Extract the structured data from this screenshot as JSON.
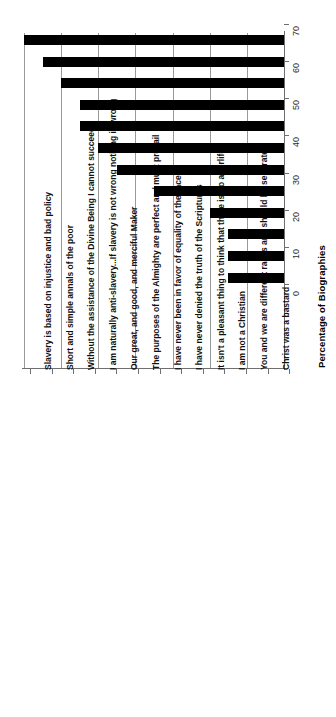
{
  "chart_data": {
    "type": "bar",
    "orientation": "vertical-rotated",
    "title": "",
    "subtitle": "",
    "xlabel": "",
    "ylabel": "Percentage of Biographies",
    "ylim": [
      0,
      70
    ],
    "ytick_step": 10,
    "yticks": [
      0,
      10,
      20,
      30,
      40,
      50,
      60,
      70
    ],
    "ytick_labels": [
      "0",
      "10",
      "20",
      "30",
      "40",
      "50",
      "60",
      "70"
    ],
    "grid": true,
    "legend": null,
    "bar_color": "#000000",
    "gridline_color": "#9a9a9a",
    "axis_color": "#6f6f6f",
    "background": "#ffffff",
    "categories": [
      "Slavery is based on injustice and bad policy",
      "Short and simple annals of the poor",
      "Without the assistance of the Divine Being I cannot succeed",
      "I am naturally anti-slavery...If slavery is not wrong nothing is wrong",
      "Our great, and good, and merciful Maker",
      "The purposes of the Almighty are perfect and must prevail",
      "I have never been in favor of equality of the races",
      "I have never denied the truth of the Scriptures",
      "It isn't a pleasant thing to think that there is no afterlife",
      "I am not a Christian",
      "You and we are different races and should be separated",
      "Christ was a bastard"
    ],
    "values": [
      70,
      65,
      60,
      55,
      55,
      50,
      45,
      35,
      20,
      15,
      15,
      15
    ]
  }
}
